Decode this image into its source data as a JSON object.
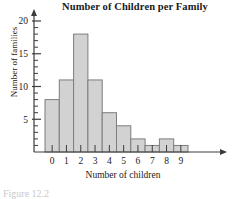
{
  "chart_data": {
    "type": "bar",
    "title": "Number of Children per Family",
    "xlabel": "Number of children",
    "ylabel": "Number of families",
    "categories": [
      "0",
      "1",
      "2",
      "3",
      "4",
      "5",
      "6",
      "7",
      "8",
      "9"
    ],
    "values": [
      8,
      11,
      18,
      11,
      6,
      4,
      2,
      1,
      2,
      1
    ],
    "ylim": [
      0,
      20
    ],
    "y_major_ticks": [
      5,
      10,
      15,
      20
    ],
    "y_major_tick_labels": [
      "5",
      "10",
      "15",
      "20"
    ],
    "y_minor_tick_step": 1,
    "grid": false,
    "legend": false,
    "bar_fill_color": "#d2d2d2",
    "bar_border_color": "#7d7d7d",
    "axis_color": "#3c3c3c",
    "axis_arrows": true
  },
  "caption": {
    "text": "Figure 12.2"
  }
}
